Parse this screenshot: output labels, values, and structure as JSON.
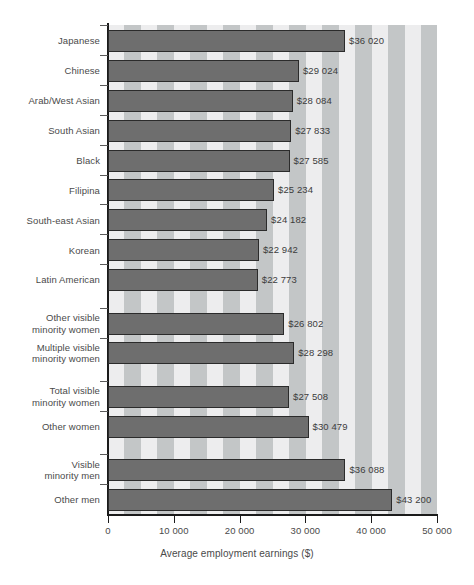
{
  "chart_data": {
    "type": "bar",
    "orientation": "horizontal",
    "title": "",
    "xlabel": "Average employment earnings ($)",
    "ylabel": "",
    "xlim": [
      0,
      50000
    ],
    "xticks": [
      0,
      10000,
      20000,
      30000,
      40000,
      50000
    ],
    "xtick_labels": [
      "0",
      "10 000",
      "20 000",
      "30 000",
      "40 000",
      "50 000"
    ],
    "grid": false,
    "legend": "none",
    "bar_color": "#6e6e6e",
    "bar_edge_color": "#2b2b2b",
    "background_stripe_light": "#ededee",
    "background_stripe_dark": "#c3c6c7",
    "categories": [
      "Japanese",
      "Chinese",
      "Arab/West Asian",
      "South Asian",
      "Black",
      "Filipina",
      "South-east Asian",
      "Korean",
      "Latin American",
      "Other visible\nminority women",
      "Multiple visible\nminority women",
      "Total visible\nminority women",
      "Other women",
      "Visible\nminority men",
      "Other men"
    ],
    "values": [
      36020,
      29024,
      28084,
      27833,
      27585,
      25234,
      24182,
      22942,
      22773,
      26802,
      28298,
      27508,
      30479,
      36088,
      43200
    ],
    "value_labels": [
      "$36 020",
      "$29 024",
      "$28 084",
      "$27 833",
      "$27 585",
      "$25 234",
      "$24 182",
      "$22 942",
      "$22 773",
      "$26 802",
      "$28 298",
      "$27 508",
      "$30 479",
      "$36 088",
      "$43 200"
    ]
  }
}
